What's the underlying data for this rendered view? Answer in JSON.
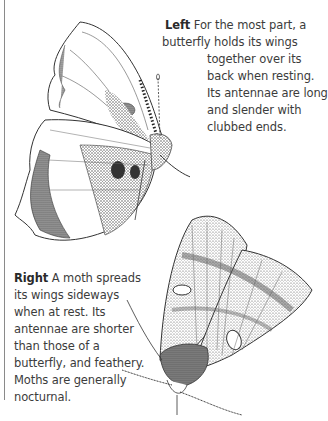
{
  "page": {
    "cut_top_text": "                                              "
  },
  "captions": {
    "left": {
      "label": "Left",
      "lines": [
        " For the most part, a",
        "butterfly holds its wings",
        "together over its",
        "back when resting.",
        "Its antennae are long",
        "and slender with",
        "clubbed ends."
      ]
    },
    "right": {
      "label": "Right",
      "lines": [
        " A moth spreads",
        "its wings sideways",
        "when at rest. Its",
        "antennae are shorter",
        "than those of a",
        "butterfly, and feathery.",
        "Moths are generally",
        "nocturnal."
      ]
    }
  },
  "illustrations": {
    "butterfly": "butterfly-illustration",
    "moth": "moth-illustration"
  }
}
